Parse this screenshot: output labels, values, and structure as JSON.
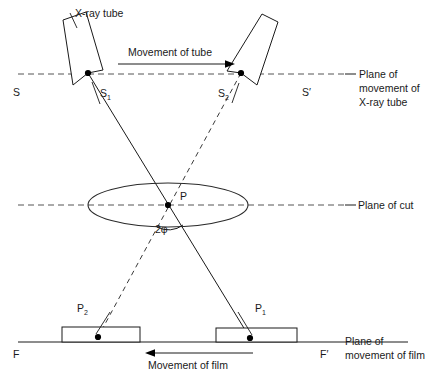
{
  "figure": {
    "background_color": "#ffffff",
    "line_color": "#1a1a1a",
    "dash_color": "#555555"
  },
  "labels": {
    "xray_tube": "X-ray tube",
    "movement_of_tube": "Movement of tube",
    "movement_of_film": "Movement of film",
    "plane_tube_line1": "Plane of",
    "plane_tube_line2": "movement of",
    "plane_tube_line3": "X-ray tube",
    "plane_of_cut": "Plane of cut",
    "plane_film_line1": "Plane of",
    "plane_film_line2": "movement of film",
    "S": "S",
    "S_prime": "S′",
    "S1_base": "S",
    "S1_sub": "1",
    "S2_base": "S",
    "S2_sub": "2",
    "P": "P",
    "P1_base": "P",
    "P1_sub": "1",
    "P2_base": "P",
    "P2_sub": "2",
    "angle": "2φ",
    "F": "F",
    "F_prime": "F′"
  },
  "geometry": {
    "plane_tube_y": 74,
    "plane_cut_y": 205,
    "plane_film_y": 342,
    "source_1": {
      "x": 88,
      "y": 73
    },
    "source_2": {
      "x": 241,
      "y": 73
    },
    "focus_point": {
      "x": 168,
      "y": 205
    },
    "image_1": {
      "x": 250,
      "y": 338
    },
    "image_2": {
      "x": 98,
      "y": 337
    },
    "ellipse": {
      "cx": 168,
      "cy": 205,
      "rx": 80,
      "ry": 22
    }
  }
}
